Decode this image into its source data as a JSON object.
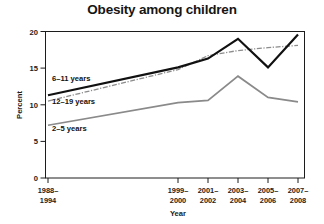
{
  "chart_data": {
    "type": "line",
    "title": "Obesity among children",
    "xlabel": "Year",
    "ylabel": "Percent",
    "categories": [
      "1988–\n1994",
      "1999–\n2000",
      "2001–\n2002",
      "2003–\n2004",
      "2005–\n2006",
      "2007–\n2008"
    ],
    "xtick_labels": [
      {
        "line1": "1988–",
        "line2": "1994"
      },
      {
        "line1": "1999–",
        "line2": "2000"
      },
      {
        "line1": "2001–",
        "line2": "2002"
      },
      {
        "line1": "2003–",
        "line2": "2004"
      },
      {
        "line1": "2005–",
        "line2": "2006"
      },
      {
        "line1": "2007–",
        "line2": "2008"
      }
    ],
    "ytick_labels": [
      "0",
      "5",
      "10",
      "15",
      "20"
    ],
    "ytick_values": [
      0,
      5,
      10,
      15,
      20
    ],
    "ylim": [
      0,
      20
    ],
    "grid": false,
    "legend_position": "inline-left",
    "series": [
      {
        "name": "6–11 years",
        "style": "solid",
        "color": "#111111",
        "values": [
          11.3,
          15.1,
          16.3,
          19.0,
          15.1,
          19.6
        ]
      },
      {
        "name": "12–19 years",
        "style": "dash-dot",
        "color": "#8c8c8c",
        "values": [
          10.5,
          14.8,
          16.7,
          17.4,
          17.8,
          18.1
        ]
      },
      {
        "name": "2–5 years",
        "style": "solid",
        "color": "#8a8a8a",
        "values": [
          7.2,
          10.3,
          10.6,
          13.9,
          11.0,
          10.4
        ]
      }
    ]
  },
  "axes": {
    "x_label": "Year",
    "y_label": "Percent"
  },
  "series_labels": [
    {
      "text": "6–11 years"
    },
    {
      "text": "12–19 years"
    },
    {
      "text": "2–5 years"
    }
  ]
}
